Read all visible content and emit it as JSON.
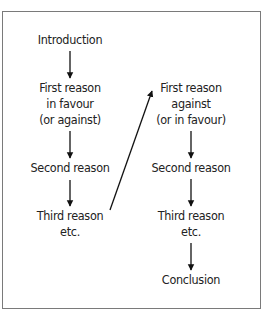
{
  "diagram": {
    "left_column": [
      {
        "id": "intro",
        "lines": [
          "Introduction"
        ]
      },
      {
        "id": "first-for",
        "lines": [
          "First reason",
          "in favour",
          "(or against)"
        ]
      },
      {
        "id": "second-left",
        "lines": [
          "Second reason"
        ]
      },
      {
        "id": "third-left",
        "lines": [
          "Third reason",
          "etc."
        ]
      }
    ],
    "right_column": [
      {
        "id": "first-against",
        "lines": [
          "First reason",
          "against",
          "(or in favour)"
        ]
      },
      {
        "id": "second-right",
        "lines": [
          "Second reason"
        ]
      },
      {
        "id": "third-right",
        "lines": [
          "Third reason",
          "etc."
        ]
      },
      {
        "id": "conclusion",
        "lines": [
          "Conclusion"
        ]
      }
    ],
    "edges": [
      [
        "intro",
        "first-for"
      ],
      [
        "first-for",
        "second-left"
      ],
      [
        "second-left",
        "third-left"
      ],
      [
        "third-left",
        "first-against"
      ],
      [
        "first-against",
        "second-right"
      ],
      [
        "second-right",
        "third-right"
      ],
      [
        "third-right",
        "conclusion"
      ]
    ],
    "colors": {
      "border": "#7a7a7a",
      "text": "#222222",
      "arrow": "#111111"
    }
  }
}
